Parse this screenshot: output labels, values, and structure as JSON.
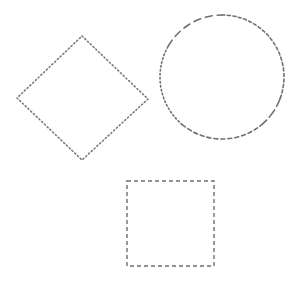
{
  "canvas": {
    "width": 297,
    "height": 284,
    "background": "#ffffff"
  },
  "shapes": [
    {
      "type": "diamond",
      "name": "diamond-shape",
      "points": [
        [
          82,
          36
        ],
        [
          148,
          99
        ],
        [
          82,
          160
        ],
        [
          17,
          98
        ]
      ],
      "stroke": "#7a7a7a",
      "dash": "1.2 2.6",
      "stroke_width": 1.6
    },
    {
      "type": "circle",
      "name": "circle-shape",
      "cx": 222,
      "cy": 77,
      "r": 62,
      "stroke": "#707070",
      "stroke_width": 1.6
    },
    {
      "type": "rect",
      "name": "square-shape",
      "x": 127,
      "y": 181,
      "width": 87,
      "height": 85,
      "stroke": "#6e6e6e",
      "dash": "4 3",
      "stroke_width": 1.4
    }
  ]
}
